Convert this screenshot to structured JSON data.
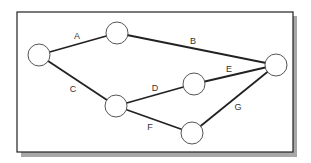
{
  "diagram": {
    "type": "network-graph",
    "colors": {
      "frame_border": "#222222",
      "shadow": "#8a8a8a",
      "edge": "#222222",
      "node_fill": "#ffffff",
      "node_stroke": "#555555",
      "label": "#333333"
    },
    "nodes": [
      {
        "id": "n1",
        "cx": 39,
        "cy": 55,
        "r": 11
      },
      {
        "id": "n2",
        "cx": 117,
        "cy": 33,
        "r": 11
      },
      {
        "id": "n3",
        "cx": 276,
        "cy": 65,
        "r": 11
      },
      {
        "id": "n4",
        "cx": 194,
        "cy": 84,
        "r": 11
      },
      {
        "id": "n5",
        "cx": 116,
        "cy": 106,
        "r": 11
      },
      {
        "id": "n6",
        "cx": 192,
        "cy": 133,
        "r": 11
      }
    ],
    "edges": [
      {
        "label": "A",
        "from": "n1",
        "to": "n2",
        "lx": 77,
        "ly": 39
      },
      {
        "label": "B",
        "from": "n2",
        "to": "n3",
        "lx": 193,
        "ly": 44
      },
      {
        "label": "C",
        "from": "n1",
        "to": "n5",
        "lx": 73,
        "ly": 92
      },
      {
        "label": "D",
        "from": "n5",
        "to": "n4",
        "lx": 155,
        "ly": 91
      },
      {
        "label": "E",
        "from": "n4",
        "to": "n3",
        "lx": 229,
        "ly": 72
      },
      {
        "label": "F",
        "from": "n5",
        "to": "n6",
        "lx": 150,
        "ly": 130
      },
      {
        "label": "G",
        "from": "n6",
        "to": "n3",
        "lx": 238,
        "ly": 110
      }
    ]
  }
}
